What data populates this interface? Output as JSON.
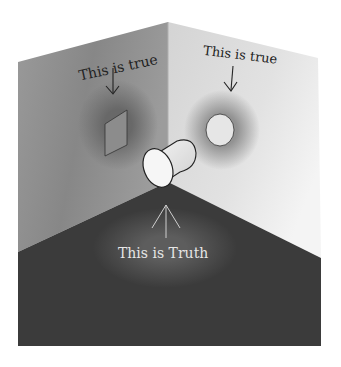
{
  "diagram": {
    "type": "illustration",
    "labels": {
      "left_wall": "This is true",
      "right_wall": "This is true",
      "floor": "This is Truth"
    },
    "shapes": {
      "left_wall_shadow": "square",
      "right_wall_shadow": "circle",
      "object": "cylinder"
    },
    "colors": {
      "left_wall": "#8a8a8a",
      "right_wall": "#d8d8d8",
      "floor": "#3a3a3a",
      "shadow_halo": "#6a6a6a",
      "floor_label": "#e8e8e8",
      "wall_label": "#222222"
    }
  }
}
